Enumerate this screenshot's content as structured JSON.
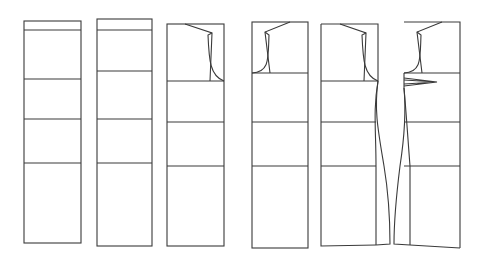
{
  "diagram": {
    "title": "Dress pattern development stages",
    "type": "sewing-pattern-progression",
    "stroke_color": "#3a3a3a",
    "background": "#ffffff",
    "panels": [
      {
        "id": 1,
        "label": "basic block with yoke band",
        "x": 24,
        "w": 57,
        "top": 21,
        "bottom": 243,
        "lines": [
          30,
          79,
          119,
          163
        ]
      },
      {
        "id": 2,
        "label": "block with adjusted bust line",
        "x": 97,
        "w": 55,
        "top": 19,
        "bottom": 246,
        "lines": [
          30,
          71,
          119,
          163
        ]
      },
      {
        "id": 3,
        "label": "back with armhole and shoulder",
        "x": 167,
        "w": 57,
        "top": 24,
        "bottom": 246,
        "lines": [
          81,
          122,
          166
        ]
      },
      {
        "id": 4,
        "label": "front with armhole and shoulder",
        "x": 252,
        "w": 56,
        "top": 22,
        "bottom": 248,
        "lines": [
          73,
          122,
          166
        ]
      },
      {
        "id": 5,
        "label": "back with shaped side seam flare",
        "x": 321,
        "w": 57,
        "top": 24,
        "bottom": 246,
        "lines": [
          81,
          122,
          166
        ]
      },
      {
        "id": 6,
        "label": "front with bust dart and side seam flare",
        "x": 404,
        "w": 56,
        "top": 22,
        "bottom": 248,
        "lines": [
          73,
          122,
          166
        ]
      }
    ]
  }
}
